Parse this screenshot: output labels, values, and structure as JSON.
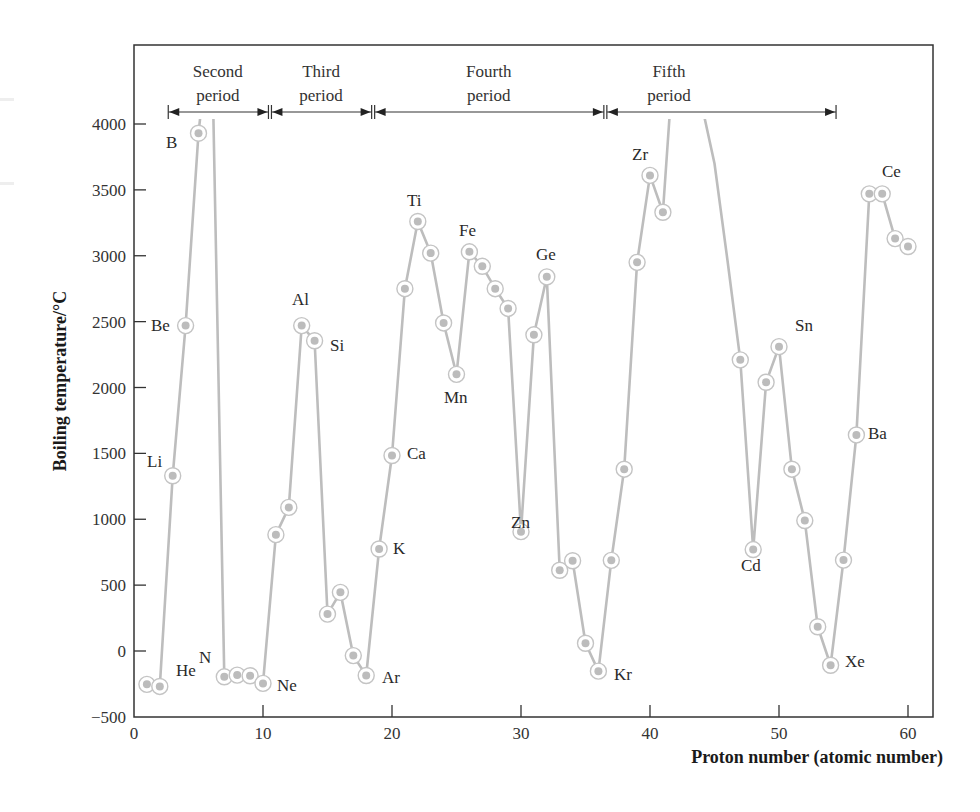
{
  "chart_data": {
    "type": "line",
    "title": "",
    "xlabel": "Proton number (atomic number)",
    "ylabel": "Boiling temperature/°C",
    "xlim": [
      0,
      62
    ],
    "ylim": [
      -500,
      4500
    ],
    "clip_top": 4050,
    "x_ticks": [
      0,
      10,
      20,
      30,
      40,
      50,
      60
    ],
    "y_ticks": [
      -500,
      0,
      500,
      1000,
      1500,
      2000,
      2500,
      3000,
      3500,
      4000
    ],
    "y_tick_labels": [
      "−500",
      "0",
      "500",
      "1000",
      "1500",
      "2000",
      "2500",
      "3000",
      "3500",
      "4000"
    ],
    "grid": false,
    "legend": null,
    "series": [
      {
        "name": "Boiling temperature",
        "x": [
          1,
          2,
          3,
          4,
          5,
          6,
          7,
          8,
          9,
          10,
          11,
          12,
          13,
          14,
          15,
          16,
          17,
          18,
          19,
          20,
          21,
          22,
          23,
          24,
          25,
          26,
          27,
          28,
          29,
          30,
          31,
          32,
          33,
          34,
          35,
          36,
          37,
          38,
          39,
          40,
          41,
          42,
          43,
          44,
          45,
          46,
          47,
          48,
          49,
          50,
          51,
          52,
          53,
          54,
          55,
          56,
          57,
          58,
          59,
          60
        ],
        "values": [
          -253,
          -269,
          1330,
          2470,
          3930,
          4830,
          -196,
          -183,
          -188,
          -246,
          883,
          1090,
          2470,
          2355,
          280,
          445,
          -35,
          -186,
          774,
          1484,
          2750,
          3260,
          3020,
          2490,
          2100,
          3030,
          2920,
          2750,
          2600,
          906,
          2400,
          2840,
          613,
          685,
          59,
          -153,
          688,
          1380,
          2950,
          3610,
          3330,
          4740,
          4880,
          4150,
          3700,
          2970,
          2210,
          770,
          2040,
          2310,
          1380,
          990,
          184,
          -108,
          690,
          1640,
          3470,
          3470,
          3130,
          3070
        ],
        "clipped_points": [
          6,
          42,
          43,
          44,
          45,
          46
        ],
        "marker": "ringed-dot",
        "color": "#bdbdbd"
      }
    ],
    "annotations": {
      "element_labels": [
        {
          "z": 1,
          "text": "He",
          "note": "label placed near point 2"
        },
        {
          "z": 2,
          "text": "He"
        },
        {
          "z": 3,
          "text": "Li"
        },
        {
          "z": 4,
          "text": "Be"
        },
        {
          "z": 5,
          "text": "B"
        },
        {
          "z": 7,
          "text": "N"
        },
        {
          "z": 10,
          "text": "Ne"
        },
        {
          "z": 13,
          "text": "Al"
        },
        {
          "z": 14,
          "text": "Si"
        },
        {
          "z": 18,
          "text": "Ar"
        },
        {
          "z": 19,
          "text": "K"
        },
        {
          "z": 20,
          "text": "Ca"
        },
        {
          "z": 22,
          "text": "Ti"
        },
        {
          "z": 25,
          "text": "Mn"
        },
        {
          "z": 26,
          "text": "Fe"
        },
        {
          "z": 30,
          "text": "Zn"
        },
        {
          "z": 32,
          "text": "Ge"
        },
        {
          "z": 36,
          "text": "Kr"
        },
        {
          "z": 40,
          "text": "Zr"
        },
        {
          "z": 48,
          "text": "Cd"
        },
        {
          "z": 50,
          "text": "Sn"
        },
        {
          "z": 54,
          "text": "Xe"
        },
        {
          "z": 56,
          "text": "Ba"
        },
        {
          "z": 58,
          "text": "Ce"
        }
      ],
      "periods": [
        {
          "line1": "Second",
          "line2": "period",
          "from": 2.5,
          "to": 10.5
        },
        {
          "line1": "Third",
          "line2": "period",
          "from": 10.5,
          "to": 18.5
        },
        {
          "line1": "Fourth",
          "line2": "period",
          "from": 18.5,
          "to": 36.5
        },
        {
          "line1": "Fifth",
          "line2": "period",
          "from": 36.5,
          "to": 54.5
        }
      ]
    }
  },
  "labels": {
    "He": "He",
    "Li": "Li",
    "Be": "Be",
    "B": "B",
    "N": "N",
    "Ne": "Ne",
    "Al": "Al",
    "Si": "Si",
    "Ar": "Ar",
    "K": "K",
    "Ca": "Ca",
    "Ti": "Ti",
    "Mn": "Mn",
    "Fe": "Fe",
    "Zn": "Zn",
    "Ge": "Ge",
    "Kr": "Kr",
    "Zr": "Zr",
    "Cd": "Cd",
    "Sn": "Sn",
    "Xe": "Xe",
    "Ba": "Ba",
    "Ce": "Ce"
  },
  "axes": {
    "xlabel": "Proton number (atomic number)",
    "ylabel": "Boiling temperature/°C",
    "x_ticks": [
      "0",
      "10",
      "20",
      "30",
      "40",
      "50",
      "60"
    ],
    "y_ticks": [
      "−500",
      "0",
      "500",
      "1000",
      "1500",
      "2000",
      "2500",
      "3000",
      "3500",
      "4000"
    ]
  },
  "periods": [
    {
      "line1": "Second",
      "line2": "period"
    },
    {
      "line1": "Third",
      "line2": "period"
    },
    {
      "line1": "Fourth",
      "line2": "period"
    },
    {
      "line1": "Fifth",
      "line2": "period"
    }
  ]
}
